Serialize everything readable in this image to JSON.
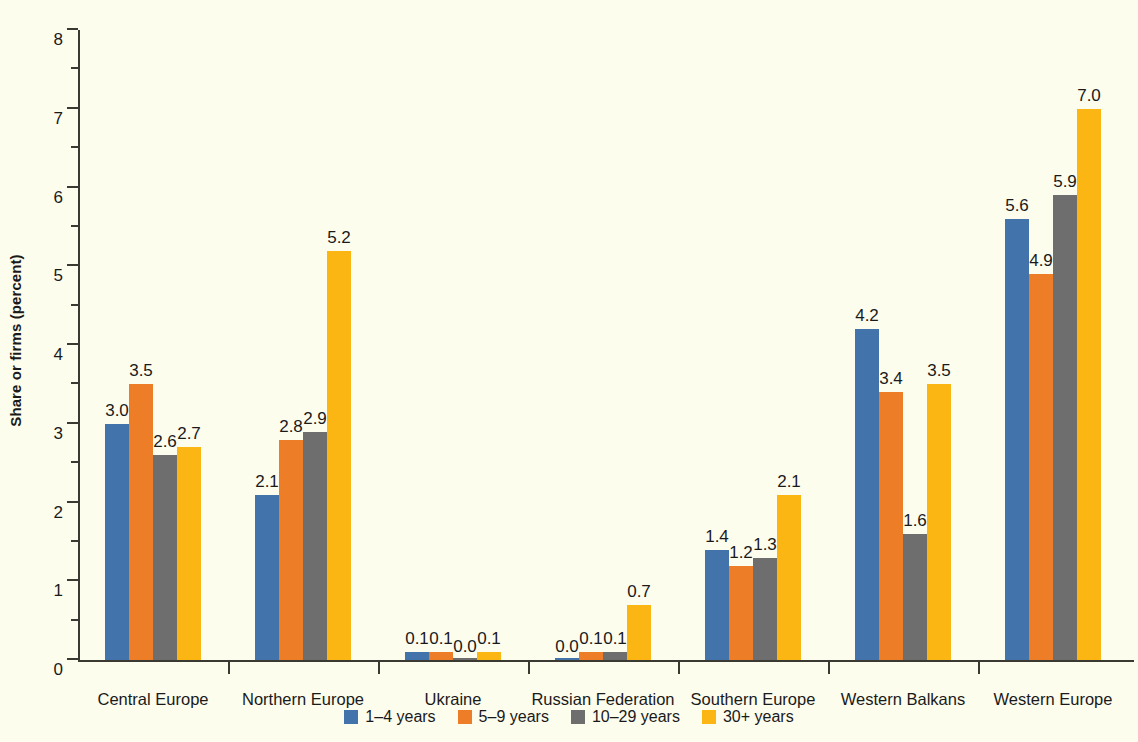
{
  "chart_data": {
    "type": "bar",
    "title": "",
    "xlabel": "",
    "ylabel": "Share or firms (percent)",
    "ylim": [
      0,
      8
    ],
    "ytick_labels": [
      "0",
      "1",
      "2",
      "3",
      "4",
      "5",
      "6",
      "7",
      "8"
    ],
    "grid": false,
    "legend_position": "bottom",
    "categories": [
      "Central Europe",
      "Northern Europe",
      "Ukraine",
      "Russian Federation",
      "Southern Europe",
      "Western Balkans",
      "Western Europe"
    ],
    "series": [
      {
        "name": "1–4 years",
        "color": "#4373ab",
        "values": [
          3.0,
          2.1,
          0.1,
          0.0,
          1.4,
          4.2,
          5.6
        ],
        "labels": [
          "3.0",
          "2.1",
          "0.1",
          "0.0",
          "1.4",
          "4.2",
          "5.6"
        ]
      },
      {
        "name": "5–9 years",
        "color": "#ee7d28",
        "values": [
          3.5,
          2.8,
          0.1,
          0.1,
          1.2,
          3.4,
          4.9
        ],
        "labels": [
          "3.5",
          "2.8",
          "0.1",
          "0.1",
          "1.2",
          "3.4",
          "4.9"
        ]
      },
      {
        "name": "10–29 years",
        "color": "#6e6e6e",
        "values": [
          2.6,
          2.9,
          0.0,
          0.1,
          1.3,
          1.6,
          5.9
        ],
        "labels": [
          "2.6",
          "2.9",
          "0.0",
          "0.1",
          "1.3",
          "1.6",
          "5.9"
        ]
      },
      {
        "name": "30+ years",
        "color": "#fbb614",
        "values": [
          2.7,
          5.2,
          0.1,
          0.7,
          2.1,
          3.5,
          7.0
        ],
        "labels": [
          "2.7",
          "5.2",
          "0.1",
          "0.7",
          "2.1",
          "3.5",
          "7.0"
        ]
      }
    ]
  },
  "axis": {
    "y_label": "Share or firms (percent)",
    "y_ticks": [
      "8",
      "7",
      "6",
      "5",
      "4",
      "3",
      "2",
      "1",
      "0"
    ]
  },
  "legend": {
    "items": [
      {
        "label": "1–4 years",
        "color": "#4373ab"
      },
      {
        "label": "5–9 years",
        "color": "#ee7d28"
      },
      {
        "label": "10–29 years",
        "color": "#6e6e6e"
      },
      {
        "label": "30+ years",
        "color": "#fbb614"
      }
    ]
  },
  "colors": {
    "background": "#fdfdee",
    "axis": "#3a3a33",
    "text": "#1a1a1a"
  }
}
